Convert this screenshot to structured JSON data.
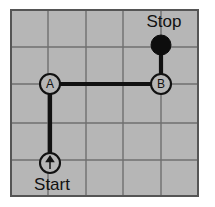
{
  "diagram": {
    "title_label": "",
    "colors": {
      "background": "#ffffff",
      "cell_fill": "#b6b6b6",
      "grid_line": "#6f6f6f",
      "border": "#555555",
      "path_stroke": "#111111",
      "node_fill": "#b6b6b6",
      "node_stroke": "#111111",
      "stop_fill": "#0d0d0d",
      "text": "#111111"
    },
    "grid": {
      "columns": 5,
      "rows": 5,
      "x_positions": [
        11,
        48,
        86,
        123,
        161,
        198
      ],
      "y_positions": [
        10,
        47,
        84,
        123,
        160,
        196
      ]
    },
    "labels": [
      {
        "id": "stop-label",
        "text": "Stop",
        "x": 164,
        "y": 27,
        "anchor": "middle"
      },
      {
        "id": "start-label",
        "text": "Start",
        "x": 52,
        "y": 190,
        "anchor": "middle"
      }
    ],
    "nodes": [
      {
        "id": "start-node",
        "kind": "start-arrow",
        "label": "",
        "x": 50,
        "y": 163,
        "r": 10
      },
      {
        "id": "node-a",
        "kind": "waypoint",
        "label": "A",
        "x": 50,
        "y": 84,
        "r": 10
      },
      {
        "id": "node-b",
        "kind": "waypoint",
        "label": "B",
        "x": 161,
        "y": 84,
        "r": 10
      },
      {
        "id": "stop-node",
        "kind": "stop-dot",
        "label": "",
        "x": 161,
        "y": 45,
        "r": 10
      }
    ],
    "path_segments": [
      {
        "id": "segment-start-to-a",
        "from": "start-node",
        "to": "node-a",
        "x1": 50,
        "y1": 163,
        "x2": 50,
        "y2": 84
      },
      {
        "id": "segment-a-to-b",
        "from": "node-a",
        "to": "node-b",
        "x1": 50,
        "y1": 84,
        "x2": 161,
        "y2": 84
      },
      {
        "id": "segment-b-to-stop",
        "from": "node-b",
        "to": "stop-node",
        "x1": 161,
        "y1": 84,
        "x2": 161,
        "y2": 45
      }
    ]
  }
}
